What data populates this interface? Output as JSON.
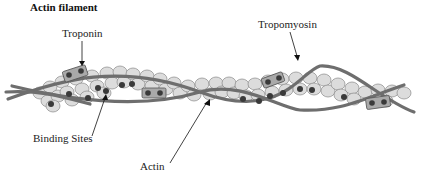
{
  "diagram": {
    "title": "Actin filament",
    "labels": {
      "troponin": "Troponin",
      "tropomyosin": "Tropomyosin",
      "binding_sites": "Binding Sites",
      "actin": "Actin"
    },
    "colors": {
      "background": "#ffffff",
      "actin_monomer_fill": "#dcdcdc",
      "actin_monomer_stroke": "#8a8a8a",
      "tropomyosin_strand": "#6e6e6e",
      "troponin_complex": "#a9a9a9",
      "binding_site_dot": "#3a3a3a",
      "text": "#111111"
    },
    "components": [
      "Actin monomers (double helix)",
      "Tropomyosin strands",
      "Troponin complexes",
      "Myosin binding sites"
    ]
  }
}
